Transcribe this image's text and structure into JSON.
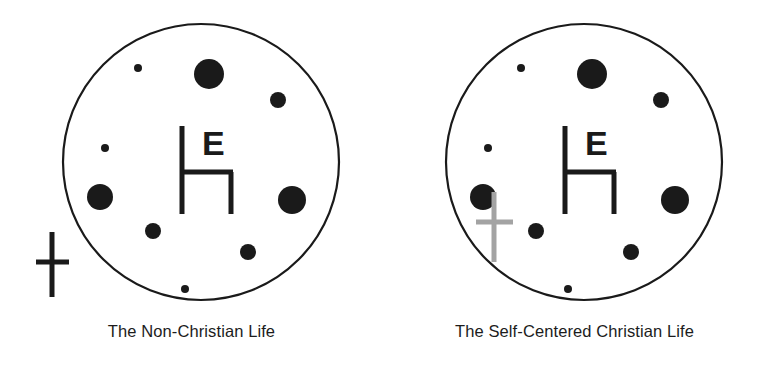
{
  "figure": {
    "background_color": "#ffffff",
    "ink_color": "#1a1a1a",
    "muted_color": "#a3a3a3"
  },
  "panels": [
    {
      "id": "non-christian",
      "caption": "The Non-Christian Life",
      "circle": {
        "cx": 201,
        "cy": 162,
        "r": 138,
        "stroke": "#1a1a1a",
        "stroke_width": 2.2,
        "fill": "#ffffff"
      },
      "throne": {
        "label": "E",
        "back_x": 182,
        "back_top": 126,
        "back_bottom": 214,
        "seat_y": 172,
        "seat_x1": 182,
        "seat_x2": 233,
        "leg_x": 231,
        "leg_bottom": 214,
        "stroke_width": 5,
        "letter_x": 202,
        "letter_y": 155,
        "letter_size": 34
      },
      "cross": {
        "position": "outside-lower-left",
        "color": "#1a1a1a",
        "cx": 52,
        "vertical_top": 232,
        "vertical_bottom": 297,
        "horizontal_y": 262,
        "horizontal_x1": 36,
        "horizontal_x2": 69,
        "stroke_width": 5
      },
      "dots": [
        {
          "cx": 138,
          "cy": 68,
          "r": 4
        },
        {
          "cx": 209,
          "cy": 74,
          "r": 15
        },
        {
          "cx": 278,
          "cy": 100,
          "r": 8
        },
        {
          "cx": 105,
          "cy": 148,
          "r": 4
        },
        {
          "cx": 100,
          "cy": 197,
          "r": 13
        },
        {
          "cx": 292,
          "cy": 200,
          "r": 14
        },
        {
          "cx": 153,
          "cy": 231,
          "r": 8
        },
        {
          "cx": 248,
          "cy": 252,
          "r": 8
        },
        {
          "cx": 185,
          "cy": 289,
          "r": 4
        }
      ]
    },
    {
      "id": "self-centered",
      "caption": "The Self-Centered Christian Life",
      "circle": {
        "cx": 201,
        "cy": 162,
        "r": 138,
        "stroke": "#1a1a1a",
        "stroke_width": 2.2,
        "fill": "#ffffff"
      },
      "throne": {
        "label": "E",
        "back_x": 182,
        "back_top": 126,
        "back_bottom": 214,
        "seat_y": 172,
        "seat_x1": 182,
        "seat_x2": 233,
        "leg_x": 231,
        "leg_bottom": 214,
        "stroke_width": 5,
        "letter_x": 202,
        "letter_y": 155,
        "letter_size": 34
      },
      "cross": {
        "position": "inside-lower-left",
        "color": "#a3a3a3",
        "cx": 111,
        "vertical_top": 192,
        "vertical_bottom": 262,
        "horizontal_y": 222,
        "horizontal_x1": 93,
        "horizontal_x2": 130,
        "stroke_width": 5
      },
      "dots": [
        {
          "cx": 138,
          "cy": 68,
          "r": 4
        },
        {
          "cx": 209,
          "cy": 74,
          "r": 15
        },
        {
          "cx": 278,
          "cy": 100,
          "r": 8
        },
        {
          "cx": 105,
          "cy": 148,
          "r": 4
        },
        {
          "cx": 100,
          "cy": 197,
          "r": 13
        },
        {
          "cx": 292,
          "cy": 200,
          "r": 14
        },
        {
          "cx": 153,
          "cy": 231,
          "r": 8
        },
        {
          "cx": 248,
          "cy": 252,
          "r": 8
        },
        {
          "cx": 185,
          "cy": 289,
          "r": 4
        }
      ]
    }
  ]
}
